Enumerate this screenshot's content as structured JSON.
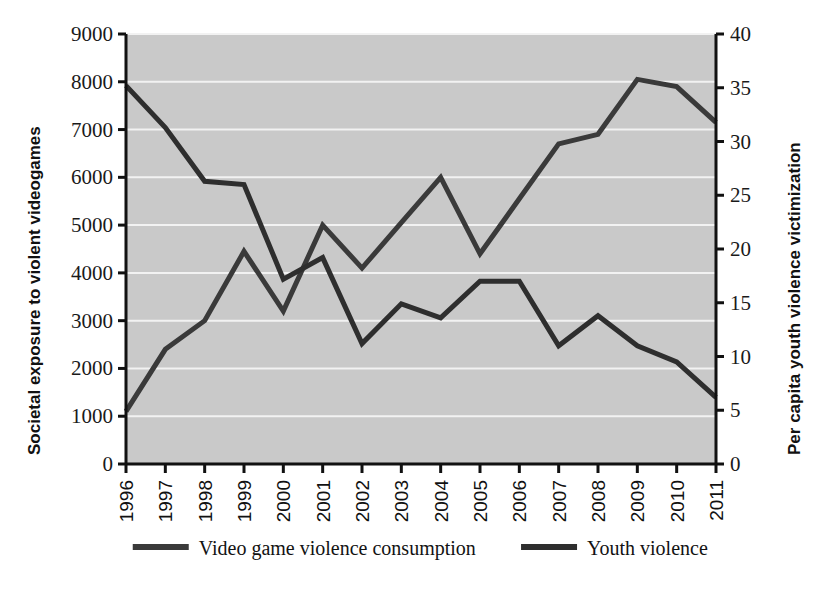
{
  "chart_data": {
    "type": "line",
    "title": "",
    "subtitle": "",
    "xlabel": "",
    "ylabel": "Societal exposure to violent videogames",
    "y2label": "Per capita youth violence victimization",
    "grid": true,
    "legend_position": "bottom",
    "plot_background": "#c9c9c9",
    "gridline_color": "#f2f2f2",
    "axis_color": "#111111",
    "line_color": "#3a3a3a",
    "categories": [
      "1996",
      "1997",
      "1998",
      "1999",
      "2000",
      "2001",
      "2002",
      "2003",
      "2004",
      "2005",
      "2006",
      "2007",
      "2008",
      "2009",
      "2010",
      "2011"
    ],
    "x_tick_labels": [
      "1996",
      "1997",
      "1998",
      "1999",
      "2000",
      "2001",
      "2002",
      "2003",
      "2004",
      "2005",
      "2006",
      "2007",
      "2008",
      "2009",
      "2010",
      "2011"
    ],
    "ylim": [
      0,
      9000
    ],
    "y_ticks": [
      0,
      1000,
      2000,
      3000,
      4000,
      5000,
      6000,
      7000,
      8000,
      9000
    ],
    "y_tick_labels": [
      "0",
      "1000",
      "2000",
      "3000",
      "4000",
      "5000",
      "6000",
      "7000",
      "8000",
      "9000"
    ],
    "y2lim": [
      0,
      40
    ],
    "y2_ticks": [
      0,
      5,
      10,
      15,
      20,
      25,
      30,
      35,
      40
    ],
    "y2_tick_labels": [
      "0",
      "5",
      "10",
      "15",
      "20",
      "25",
      "30",
      "35",
      "40"
    ],
    "series": [
      {
        "name": "Video game violence consumption",
        "axis": "left",
        "color": "#3a3a3a",
        "values": [
          1100,
          2400,
          3000,
          4450,
          3200,
          5000,
          4100,
          5050,
          6000,
          4400,
          5550,
          6700,
          6900,
          8050,
          7900,
          7150
        ]
      },
      {
        "name": "Youth violence",
        "axis": "right",
        "color": "#2e2e2e",
        "values": [
          35.2,
          31.3,
          26.3,
          26.0,
          17.2,
          19.2,
          11.2,
          14.9,
          13.6,
          17.0,
          17.0,
          11.0,
          13.8,
          11.0,
          9.5,
          6.2
        ]
      }
    ],
    "legend": [
      {
        "label": "Video game violence consumption",
        "color": "#3a3a3a"
      },
      {
        "label": "Youth violence",
        "color": "#2e2e2e"
      }
    ]
  }
}
